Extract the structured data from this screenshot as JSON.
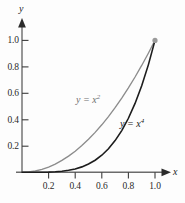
{
  "chart_data": {
    "type": "line",
    "title": "",
    "subtitle": "",
    "xlabel": "x",
    "ylabel": "y",
    "xlim": [
      0,
      1.08
    ],
    "ylim": [
      0,
      1.08
    ],
    "grid": false,
    "legend_position": "inline-annotations",
    "xticks": [
      "0.2",
      "0.4",
      "0.6",
      "0.8",
      "1.0"
    ],
    "xtick_values": [
      0.2,
      0.4,
      0.6,
      0.8,
      1.0
    ],
    "yticks": [
      "0.2",
      "0.4",
      "0.6",
      "0.8",
      "1.0"
    ],
    "ytick_values": [
      0.2,
      0.4,
      0.6,
      0.8,
      1.0
    ],
    "x": [
      0,
      0.05,
      0.1,
      0.15,
      0.2,
      0.25,
      0.3,
      0.35,
      0.4,
      0.45,
      0.5,
      0.55,
      0.6,
      0.65,
      0.7,
      0.75,
      0.8,
      0.85,
      0.9,
      0.95,
      1.0
    ],
    "series": [
      {
        "name": "y = x^2",
        "label_text": "y = x",
        "label_exponent": "2",
        "color": "#8c8c8c",
        "values": [
          0,
          0.0025,
          0.01,
          0.0225,
          0.04,
          0.0625,
          0.09,
          0.1225,
          0.16,
          0.2025,
          0.25,
          0.3025,
          0.36,
          0.4225,
          0.49,
          0.5625,
          0.64,
          0.7225,
          0.81,
          0.9025,
          1.0
        ]
      },
      {
        "name": "y = x^4",
        "label_text": "y = x",
        "label_exponent": "4",
        "color": "#1c1c1c",
        "values": [
          0,
          6.25e-06,
          0.0001,
          0.00050625,
          0.0016,
          0.00390625,
          0.0081,
          0.01500625,
          0.0256,
          0.04100625,
          0.0625,
          0.09150625,
          0.1296,
          0.17850625,
          0.2401,
          0.31640625,
          0.4096,
          0.52200625,
          0.6561,
          0.81450625,
          1.0
        ]
      }
    ],
    "markers": [
      {
        "name": "intersection-point",
        "x": 1.0,
        "y": 1.0,
        "color": "#9a9a9a"
      }
    ]
  },
  "axes": {
    "x_axis_name": "x",
    "y_axis_name": "y",
    "axis_color": "#555555",
    "arrow_color": "#2b2b2b"
  }
}
